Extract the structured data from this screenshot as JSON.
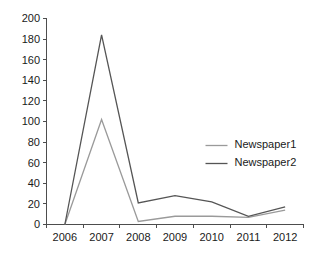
{
  "chart_data": {
    "type": "line",
    "title": "",
    "xlabel": "",
    "ylabel": "",
    "categories": [
      "2006",
      "2007",
      "2008",
      "2009",
      "2010",
      "2011",
      "2012"
    ],
    "x": [
      2006,
      2007,
      2008,
      2009,
      2010,
      2011,
      2012
    ],
    "series": [
      {
        "name": "Newspaper1",
        "color": "#9a9a9a",
        "values": [
          0,
          102,
          3,
          8,
          8,
          7,
          14
        ]
      },
      {
        "name": "Newspaper2",
        "color": "#555555",
        "values": [
          0,
          184,
          21,
          28,
          22,
          8,
          17
        ]
      }
    ],
    "ylim": [
      0,
      200
    ],
    "ytick_step": 20,
    "yticks": [
      0,
      20,
      40,
      60,
      80,
      100,
      120,
      140,
      160,
      180,
      200
    ],
    "ytick_labels": [
      "0",
      "20",
      "40",
      "60",
      "80",
      "100",
      "120",
      "140",
      "160",
      "180",
      "200"
    ],
    "xtick_labels": [
      "2006",
      "2007",
      "2008",
      "2009",
      "2010",
      "2011",
      "2012"
    ],
    "grid": false,
    "legend_position": "right-center",
    "background_color": "#ffffff",
    "axis_color": "#4d4d4d"
  },
  "legend": {
    "entries": [
      {
        "label": "Newspaper1"
      },
      {
        "label": "Newspaper2"
      }
    ]
  }
}
